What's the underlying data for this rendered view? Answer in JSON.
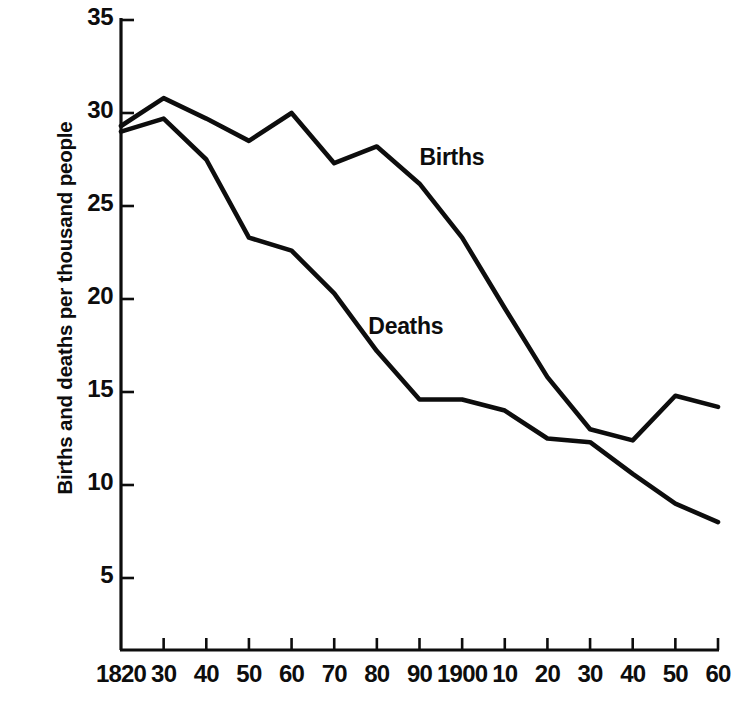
{
  "chart_data": {
    "type": "line",
    "title": "",
    "subtitle": "",
    "xlabel": "",
    "ylabel": "Births and deaths per thousand people",
    "grid": false,
    "legend_position": "inline-annotation",
    "x": [
      1820,
      1830,
      1840,
      1850,
      1860,
      1870,
      1880,
      1890,
      1900,
      1910,
      1920,
      1930,
      1940,
      1950,
      1960
    ],
    "xtick_labels": [
      "1820",
      "30",
      "40",
      "50",
      "60",
      "70",
      "80",
      "90",
      "1900",
      "10",
      "20",
      "30",
      "40",
      "50",
      "60"
    ],
    "ytick_labels": [
      "35",
      "30",
      "25",
      "20",
      "15",
      "10",
      "5"
    ],
    "ytick_values": [
      35,
      30,
      25,
      20,
      15,
      10,
      5
    ],
    "xlim": [
      1820,
      1960
    ],
    "ylim": [
      0,
      35
    ],
    "series": [
      {
        "name": "Births",
        "color": "#0d0d0d",
        "values": [
          29.3,
          30.8,
          29.7,
          28.5,
          30.0,
          27.3,
          28.2,
          26.2,
          23.3,
          19.5,
          15.8,
          13.0,
          12.4,
          14.8,
          14.2
        ]
      },
      {
        "name": "Deaths",
        "color": "#0d0d0d",
        "values": [
          29.0,
          29.7,
          27.5,
          23.3,
          22.6,
          20.3,
          17.2,
          14.6,
          14.6,
          14.0,
          12.5,
          12.3,
          10.6,
          9.0,
          8.0
        ]
      }
    ],
    "annotations": [
      {
        "text": "Births",
        "x": 1890,
        "y": 27.6
      },
      {
        "text": "Deaths",
        "x": 1878,
        "y": 18.5
      }
    ]
  }
}
